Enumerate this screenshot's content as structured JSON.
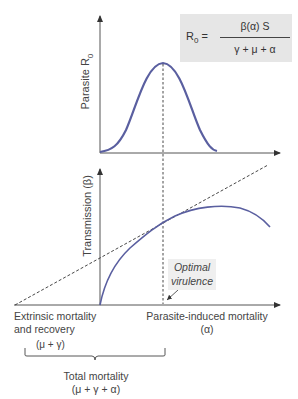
{
  "formula": {
    "lhs": "R",
    "lhs_sub": "0",
    "equals": " =",
    "numerator": "β(α) S",
    "denominator": "γ + μ + α"
  },
  "top_panel": {
    "ylabel": "Parasite R",
    "ylabel_sub": "0"
  },
  "bottom_panel": {
    "ylabel": "Transmission (β)",
    "callout_line1": "Optimal",
    "callout_line2": "virulence"
  },
  "x_axis": {
    "left_label_line1": "Extrinsic mortality",
    "left_label_line2": "and recovery",
    "right_label_line1": "Parasite-induced mortality",
    "right_label_line2": "(α)"
  },
  "bracket": {
    "label": "(μ + γ)",
    "total_line1": "Total mortality",
    "total_line2": "(μ + γ + α)"
  },
  "colors": {
    "curve": "#5a5fa0",
    "axis": "#444444",
    "formula_bg": "#e6e6e6"
  }
}
